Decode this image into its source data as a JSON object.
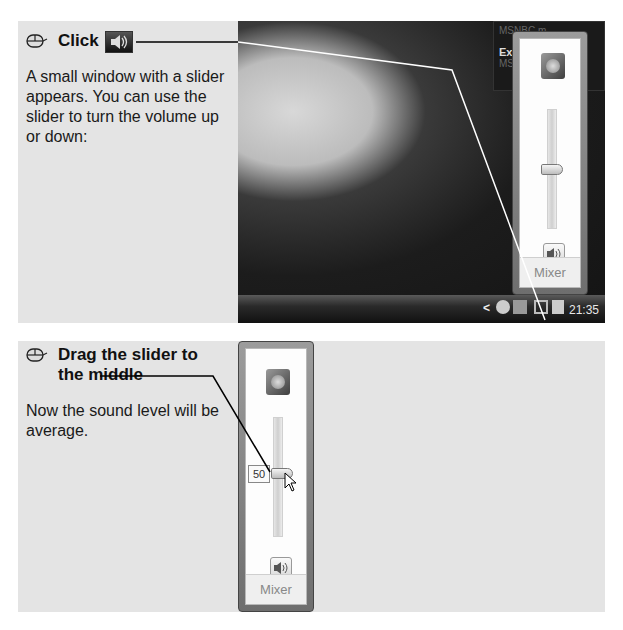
{
  "step1": {
    "action": "Click",
    "icon": "speaker-volume-icon",
    "description": "A small window with a slider appears. You can use the slider to turn the volume up or down:"
  },
  "step2": {
    "action": "Drag the slider to the middle",
    "description": "Now the sound level will be average."
  },
  "screenshot1": {
    "gadget_text_1": "MSNBC.m",
    "gadget_text_2": "Expe",
    "gadget_text_3": "MSNBC",
    "mixer_label": "Mixer",
    "clock": "21:35",
    "tray_chevron": "<"
  },
  "screenshot2": {
    "tooltip_value": "50",
    "mixer_label": "Mixer"
  },
  "colors": {
    "panel_bg": "#e4e4e4",
    "callout_line_top": "#ffffff",
    "callout_line_bottom": "#000000"
  }
}
